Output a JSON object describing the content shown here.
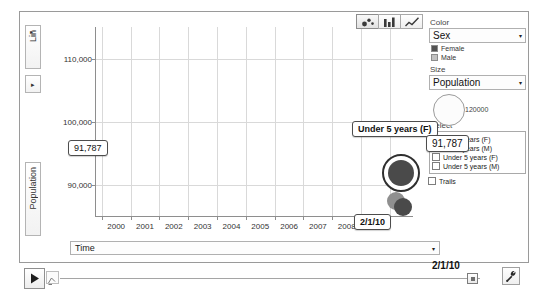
{
  "chart_data": {
    "type": "scatter",
    "title": "",
    "xlabel": "Time",
    "ylabel": "Population",
    "y_scale": "Lin",
    "yticks": [
      "110,000",
      "100,000",
      "90,000"
    ],
    "ytick_values": [
      110000,
      100000,
      90000
    ],
    "ylim": [
      85000,
      115000
    ],
    "xticks": [
      "2000",
      "2001",
      "2002",
      "2003",
      "2004",
      "2005",
      "2006",
      "2007",
      "2008",
      "2009"
    ],
    "xtick_values": [
      2000,
      2001,
      2002,
      2003,
      2004,
      2005,
      2006,
      2007,
      2008,
      2009
    ],
    "grid": true,
    "legend_position": "right",
    "current_time": "2/1/10",
    "series": [
      {
        "name": "Under 5 years (F)",
        "color": "#4a4a4a",
        "x": 2009.9,
        "y": 91787,
        "radius": 13,
        "selected": true
      },
      {
        "name": "Under 5 years (M)",
        "color": "#8f8f8f",
        "x": 2009.7,
        "y": 87400,
        "radius": 9,
        "selected": false
      },
      {
        "name": "5 to 9 years (F)",
        "color": "#4a4a4a",
        "x": 2009.95,
        "y": 86500,
        "radius": 9,
        "selected": false
      }
    ],
    "annotations": [
      {
        "text": "Under 5 years (F)",
        "kind": "series-tooltip"
      },
      {
        "text": "91,787",
        "kind": "value-tooltip"
      },
      {
        "text": "91,787",
        "kind": "y-axis-tooltip"
      },
      {
        "text": "2/1/10",
        "kind": "x-axis-tooltip"
      }
    ]
  },
  "yaxis": {
    "scale_button_label": "Lin",
    "scale_caret": "▸",
    "expand_caret": "▸",
    "axis_label": "Population",
    "tooltip_value": "91,787"
  },
  "xaxis": {
    "tooltip_value": "2/1/10"
  },
  "chart_types": [
    {
      "name": "bubble-chart",
      "label": "Bubble chart",
      "active": true
    },
    {
      "name": "bar-chart",
      "label": "Bar chart",
      "active": false
    },
    {
      "name": "line-chart",
      "label": "Line chart",
      "active": false
    }
  ],
  "bubble_tooltip": {
    "series_label": "Under 5 years (F)",
    "value_label": "91,787"
  },
  "panel": {
    "color": {
      "label": "Color",
      "selected": "Sex",
      "caret": "▾",
      "legend": [
        {
          "label": "Female",
          "color": "#525252"
        },
        {
          "label": "Male",
          "color": "#c2c2c2"
        }
      ]
    },
    "size": {
      "label": "Size",
      "selected": "Population",
      "caret": "▾",
      "max_value": "120000"
    },
    "select": {
      "label": "Select",
      "options": [
        {
          "label": "5 to 9 years (F)",
          "checked": false
        },
        {
          "label": "5 to 9 years (M)",
          "checked": false
        },
        {
          "label": "Under 5 years (F)",
          "checked": false
        },
        {
          "label": "Under 5 years (M)",
          "checked": false
        }
      ],
      "trails": {
        "label": "Trails",
        "checked": false
      }
    }
  },
  "bottom": {
    "time_select": {
      "label": "Time",
      "caret": "▾"
    },
    "play_label": "Play",
    "speed_label": "Playback speed",
    "timeline_value": "2/1/10",
    "settings_label": "Settings"
  }
}
